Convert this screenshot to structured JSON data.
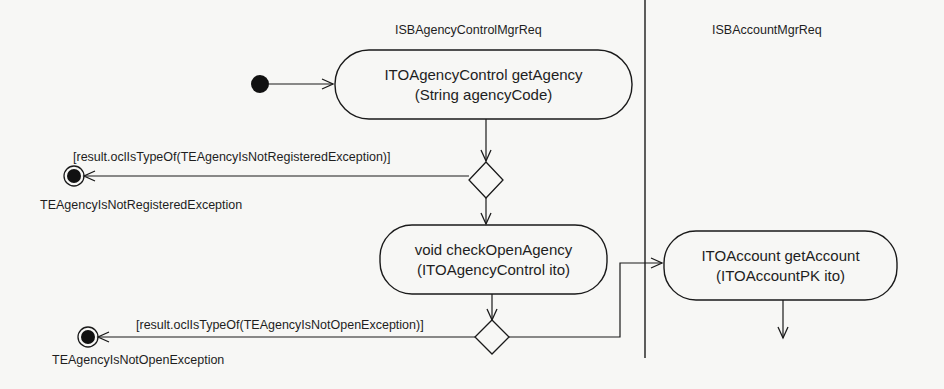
{
  "diagram": {
    "type": "UML activity diagram",
    "swimlanes": [
      {
        "id": "lane1",
        "title": "ISBAgencyControlMgrReq"
      },
      {
        "id": "lane2",
        "title": "ISBAccountMgrReq"
      }
    ],
    "activities": [
      {
        "id": "a1",
        "line1": "ITOAgencyControl getAgency",
        "line2": "(String agencyCode)",
        "lane": "lane1"
      },
      {
        "id": "a2",
        "line1": "void checkOpenAgency",
        "line2": "(ITOAgencyControl ito)",
        "lane": "lane1"
      },
      {
        "id": "a3",
        "line1": "ITOAccount getAccount",
        "line2": "(ITOAccountPK ito)",
        "lane": "lane2"
      }
    ],
    "guards": [
      {
        "id": "g1",
        "text": "[result.oclIsTypeOf(TEAgencyIsNotRegisteredException)]"
      },
      {
        "id": "g2",
        "text": "[result.oclIsTypeOf(TEAgencyIsNotOpenException)]"
      }
    ],
    "final_nodes": [
      {
        "id": "f1",
        "label": "TEAgencyIsNotRegisteredException"
      },
      {
        "id": "f2",
        "label": "TEAgencyIsNotOpenException"
      }
    ],
    "colors": {
      "background": "#f7f7f5",
      "stroke": "#1a1a1a"
    }
  }
}
